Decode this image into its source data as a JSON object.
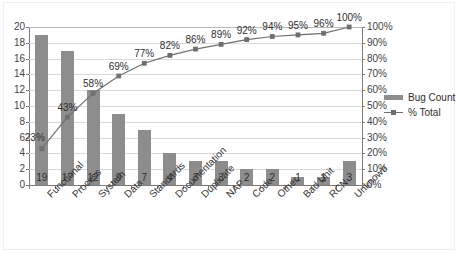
{
  "chart_data": {
    "type": "bar",
    "title": "",
    "subtitle": "",
    "xlabel": "",
    "ylabel": "",
    "categories": [
      "Functional",
      "Process",
      "System",
      "Data",
      "Standards",
      "Documentation",
      "Duplicate",
      "NAP",
      "Code",
      "Other",
      "Bad Unit",
      "RCN",
      "Unknown"
    ],
    "series": [
      {
        "name": "Bug Count",
        "type": "bar",
        "axis": "left",
        "color": "#8d8d8d",
        "values": [
          19,
          17,
          12,
          9,
          7,
          4,
          3,
          3,
          2,
          2,
          1,
          1,
          3
        ],
        "data_labels": [
          "19",
          "17",
          "12",
          "9",
          "7",
          "4",
          "3",
          "3",
          "2",
          "2",
          "1",
          "1",
          "3"
        ]
      },
      {
        "name": "% Total",
        "type": "line",
        "axis": "right",
        "color": "#6f6f6f",
        "values": [
          23,
          43,
          58,
          69,
          77,
          82,
          86,
          89,
          92,
          94,
          95,
          96,
          100
        ],
        "data_labels": [
          "23%",
          "43%",
          "58%",
          "69%",
          "77%",
          "82%",
          "86%",
          "89%",
          "92%",
          "94%",
          "95%",
          "96%",
          "100%"
        ]
      }
    ],
    "left_axis": {
      "min": 0,
      "max": 20,
      "step": 2,
      "ticks": [
        "0",
        "2",
        "4",
        "6",
        "8",
        "10",
        "12",
        "14",
        "16",
        "18",
        "20"
      ]
    },
    "right_axis": {
      "min": 0,
      "max": 100,
      "step": 10,
      "ticks": [
        "0%",
        "10%",
        "20%",
        "30%",
        "40%",
        "50%",
        "60%",
        "70%",
        "80%",
        "90%",
        "100%"
      ]
    },
    "grid": true,
    "legend_position": "right",
    "legend": [
      {
        "label": "Bug Count",
        "marker": "bar-swatch",
        "color": "#8d8d8d"
      },
      {
        "label": "% Total",
        "marker": "line-marker-swatch",
        "color": "#6f6f6f"
      }
    ]
  }
}
